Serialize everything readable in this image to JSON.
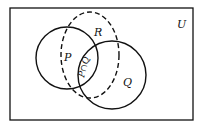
{
  "diagram": {
    "type": "venn",
    "universe_label": "U",
    "sets": [
      {
        "name": "P",
        "label": "P",
        "style": "solid"
      },
      {
        "name": "Q",
        "label": "Q",
        "style": "solid"
      },
      {
        "name": "R",
        "label": "R",
        "style": "dashed"
      }
    ],
    "intersection_label": "P∩Q",
    "colors": {
      "stroke": "#111111",
      "background": "#ffffff"
    }
  }
}
